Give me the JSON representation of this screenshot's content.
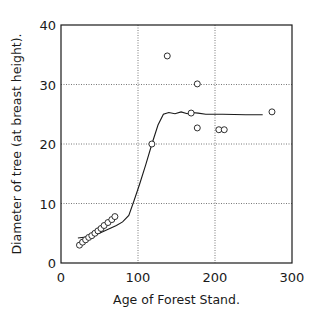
{
  "chart_data": {
    "type": "scatter",
    "title": "",
    "xlabel": "Age of Forest Stand.",
    "ylabel": "Diameter of tree (at breast height).",
    "xlim": [
      0,
      300
    ],
    "ylim": [
      0,
      40
    ],
    "x_ticks": [
      0,
      100,
      200,
      300
    ],
    "y_ticks": [
      0,
      10,
      20,
      30,
      40
    ],
    "x_tick_labels": [
      "0",
      "100",
      "200",
      "300"
    ],
    "y_tick_labels": [
      "0",
      "10",
      "20",
      "30",
      "40"
    ],
    "grid": true,
    "grid_style": "dotted",
    "legend": null,
    "series": [
      {
        "name": "observed",
        "kind": "scatter",
        "marker": "open-circle",
        "points": [
          {
            "x": 24,
            "y": 3.0
          },
          {
            "x": 28,
            "y": 3.5
          },
          {
            "x": 32,
            "y": 3.9
          },
          {
            "x": 36,
            "y": 4.3
          },
          {
            "x": 40,
            "y": 4.6
          },
          {
            "x": 44,
            "y": 5.0
          },
          {
            "x": 48,
            "y": 5.4
          },
          {
            "x": 52,
            "y": 5.8
          },
          {
            "x": 56,
            "y": 6.3
          },
          {
            "x": 61,
            "y": 6.8
          },
          {
            "x": 66,
            "y": 7.3
          },
          {
            "x": 70,
            "y": 7.8
          },
          {
            "x": 118,
            "y": 20.0
          },
          {
            "x": 138,
            "y": 34.8
          },
          {
            "x": 169,
            "y": 25.2
          },
          {
            "x": 177,
            "y": 30.1
          },
          {
            "x": 177,
            "y": 22.7
          },
          {
            "x": 205,
            "y": 22.4
          },
          {
            "x": 212,
            "y": 22.4
          },
          {
            "x": 274,
            "y": 25.4
          }
        ]
      },
      {
        "name": "fitted",
        "kind": "line",
        "points": [
          {
            "x": 22,
            "y": 4.2
          },
          {
            "x": 35,
            "y": 4.4
          },
          {
            "x": 50,
            "y": 5.0
          },
          {
            "x": 62,
            "y": 5.7
          },
          {
            "x": 72,
            "y": 6.3
          },
          {
            "x": 80,
            "y": 6.9
          },
          {
            "x": 88,
            "y": 8.0
          },
          {
            "x": 95,
            "y": 10.5
          },
          {
            "x": 102,
            "y": 13.2
          },
          {
            "x": 110,
            "y": 16.5
          },
          {
            "x": 118,
            "y": 20.0
          },
          {
            "x": 126,
            "y": 23.2
          },
          {
            "x": 133,
            "y": 25.0
          },
          {
            "x": 140,
            "y": 25.3
          },
          {
            "x": 148,
            "y": 25.1
          },
          {
            "x": 156,
            "y": 25.4
          },
          {
            "x": 164,
            "y": 25.1
          },
          {
            "x": 170,
            "y": 25.3
          },
          {
            "x": 178,
            "y": 25.2
          },
          {
            "x": 188,
            "y": 25.0
          },
          {
            "x": 210,
            "y": 25.0
          },
          {
            "x": 240,
            "y": 24.9
          },
          {
            "x": 262,
            "y": 24.9
          }
        ]
      }
    ]
  },
  "colors": {
    "background": "#ffffff",
    "ink": "#1a1a1a",
    "grid": "#555555"
  }
}
